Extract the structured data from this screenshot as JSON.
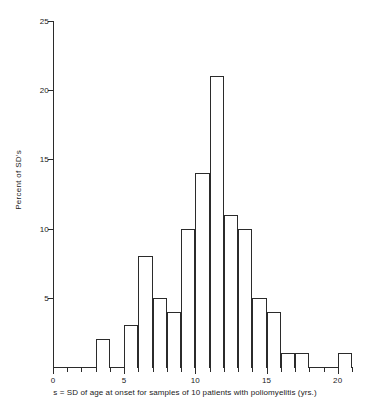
{
  "chart_data": {
    "type": "bar",
    "title": "",
    "subtitle": "",
    "xlabel": "s = SD of age at onset for samples of 10 patients with poliomyelitis (yrs.)",
    "ylabel": "Percent of SD's",
    "xlim": [
      0,
      21
    ],
    "ylim": [
      0,
      25
    ],
    "grid": false,
    "legend": null,
    "bin_width": 1,
    "x_tick_labels": [
      "0",
      "5",
      "10",
      "15",
      "20"
    ],
    "x_tick_values": [
      0,
      5,
      10,
      15,
      20
    ],
    "x_minor_ticks": [
      1,
      2,
      3,
      4,
      6,
      7,
      8,
      9,
      11,
      12,
      13,
      14,
      16,
      17,
      18,
      19,
      21
    ],
    "y_tick_labels": [
      "5",
      "10",
      "15",
      "20",
      "25"
    ],
    "y_tick_values": [
      5,
      10,
      15,
      20,
      25
    ],
    "categories": [
      "3-4",
      "4-5",
      "5-6",
      "6-7",
      "7-8",
      "8-9",
      "9-10",
      "10-11",
      "11-12",
      "12-13",
      "13-14",
      "14-15",
      "15-16",
      "16-17",
      "17-18",
      "18-19",
      "19-20",
      "20-21"
    ],
    "bins": [
      {
        "start": 3,
        "end": 4,
        "value": 2
      },
      {
        "start": 4,
        "end": 5,
        "value": 0
      },
      {
        "start": 5,
        "end": 6,
        "value": 3
      },
      {
        "start": 6,
        "end": 7,
        "value": 8
      },
      {
        "start": 7,
        "end": 8,
        "value": 5
      },
      {
        "start": 8,
        "end": 9,
        "value": 4
      },
      {
        "start": 9,
        "end": 10,
        "value": 10
      },
      {
        "start": 10,
        "end": 11,
        "value": 14
      },
      {
        "start": 11,
        "end": 12,
        "value": 21
      },
      {
        "start": 12,
        "end": 13,
        "value": 11
      },
      {
        "start": 13,
        "end": 14,
        "value": 10
      },
      {
        "start": 14,
        "end": 15,
        "value": 5
      },
      {
        "start": 15,
        "end": 16,
        "value": 4
      },
      {
        "start": 16,
        "end": 17,
        "value": 1
      },
      {
        "start": 17,
        "end": 18,
        "value": 1
      },
      {
        "start": 18,
        "end": 19,
        "value": 0
      },
      {
        "start": 19,
        "end": 20,
        "value": 0
      },
      {
        "start": 20,
        "end": 21,
        "value": 1
      }
    ],
    "values": [
      2,
      0,
      3,
      8,
      5,
      4,
      10,
      14,
      21,
      11,
      10,
      5,
      4,
      1,
      1,
      0,
      0,
      1
    ],
    "colors": {
      "bar_stroke": "#2b2b2b",
      "bar_fill": "#ffffff",
      "axis": "#2b2b2b",
      "text": "#1a1a1a",
      "background": "#ffffff"
    }
  }
}
